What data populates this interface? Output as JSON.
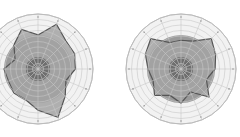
{
  "chart_data": [
    {
      "type": "radar",
      "title": "",
      "spokes": 16,
      "rings": 10,
      "center": [
        38,
        69
      ],
      "radius": 55,
      "inner_disk_radius": 0.22,
      "mid_disk_radius": 0.62,
      "series": [
        {
          "name": "profile",
          "values": [
            0.62,
            0.88,
            0.72,
            0.72,
            0.68,
            0.55,
            0.7,
            0.95,
            0.75,
            0.6,
            0.62,
            0.58,
            0.62,
            0.45,
            0.62,
            0.78
          ]
        }
      ],
      "colors": {
        "outer_fill": "#f2f2f2",
        "grid": "#c8c8c8",
        "mid_disk": "#9a9a9a",
        "inner_disk": "#6e6e6e",
        "polygon_fill": "#a3a3a3",
        "polygon_stroke": "#555555"
      }
    },
    {
      "type": "radar",
      "title": "",
      "spokes": 16,
      "rings": 10,
      "center": [
        181,
        69
      ],
      "radius": 55,
      "inner_disk_radius": 0.22,
      "mid_disk_radius": 0.62,
      "series": [
        {
          "name": "profile",
          "values": [
            0.52,
            0.55,
            0.78,
            0.68,
            0.62,
            0.5,
            0.72,
            0.45,
            0.62,
            0.52,
            0.68,
            0.55,
            0.6,
            0.7,
            0.78,
            0.52
          ]
        }
      ],
      "colors": {
        "outer_fill": "#f2f2f2",
        "grid": "#c8c8c8",
        "mid_disk": "#9a9a9a",
        "inner_disk": "#6e6e6e",
        "polygon_fill": "#a3a3a3",
        "polygon_stroke": "#555555"
      }
    }
  ]
}
